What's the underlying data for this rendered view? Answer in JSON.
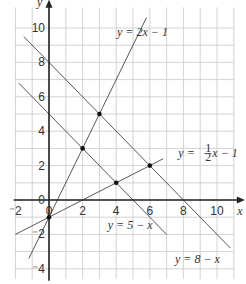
{
  "chart_data": {
    "type": "line",
    "title": "",
    "xlabel": "x",
    "ylabel": "y",
    "xlim": [
      -2,
      11
    ],
    "ylim": [
      -4.5,
      11
    ],
    "grid": true,
    "x_ticks": [
      "-2",
      "0",
      "2",
      "4",
      "6",
      "8",
      "10"
    ],
    "y_ticks": [
      "-4",
      "-2",
      "0",
      "2",
      "4",
      "6",
      "8",
      "10"
    ],
    "series": [
      {
        "name": "y = 2x - 1",
        "slope": 2,
        "intercept": -1,
        "x_range": [
          -1.2,
          5.8
        ]
      },
      {
        "name": "y = 1/2 x - 1",
        "slope": 0.5,
        "intercept": -1,
        "x_range": [
          -2,
          6.8
        ]
      },
      {
        "name": "y = 5 - x",
        "slope": -1,
        "intercept": 5,
        "x_range": [
          -1.8,
          7
        ]
      },
      {
        "name": "y = 8 - x",
        "slope": -1,
        "intercept": 8,
        "x_range": [
          -1.5,
          10.8
        ]
      }
    ],
    "points": [
      {
        "x": 0,
        "y": -1
      },
      {
        "x": 2,
        "y": 3
      },
      {
        "x": 3,
        "y": 5
      },
      {
        "x": 4,
        "y": 1
      },
      {
        "x": 6,
        "y": 2
      }
    ],
    "annotations": [
      {
        "text": "y = 2x − 1",
        "near": [
          6.5,
          9
        ]
      },
      {
        "text": "y = ½x − 1",
        "near": [
          8.5,
          2.4
        ]
      },
      {
        "text": "y = 5 − x",
        "near": [
          5.5,
          -1.5
        ]
      },
      {
        "text": "y = 8 − x",
        "near": [
          8,
          -3
        ]
      }
    ]
  },
  "labels": {
    "x_axis": "x",
    "y_axis": "y",
    "eq1": "y = 2x − 1",
    "eq2_pre": "y = ",
    "eq2_num": "1",
    "eq2_den": "2",
    "eq2_post": "x − 1",
    "eq3": "y = 5 − x",
    "eq4": "y = 8 − x",
    "origin": "0",
    "origin_x": "0"
  }
}
